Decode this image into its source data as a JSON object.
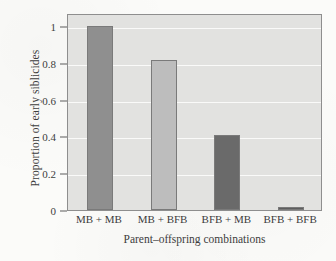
{
  "chart_data": {
    "type": "bar",
    "title": "",
    "xlabel": "Parent–offspring combinations",
    "ylabel": "Proportion of early siblicides",
    "categories": [
      "MB + MB",
      "MB + BFB",
      "BFB + MB",
      "BFB + BFB"
    ],
    "values": [
      1.0,
      0.815,
      0.41,
      0.015
    ],
    "bar_colors": [
      "#8f8f8f",
      "#bdbdbd",
      "#6a6a6a",
      "#5e5e5e"
    ],
    "ylim": [
      0,
      1.07
    ],
    "yticks": [
      0,
      0.2,
      0.4,
      0.6,
      0.8,
      1
    ],
    "ytick_labels": [
      "0",
      "0.2",
      "0.4",
      "0.6",
      "0.8",
      "1"
    ],
    "grid": true,
    "grid_color": "#fbfbfa",
    "legend": "none",
    "panel_color": "#e2e2e0",
    "frame_color": "#8e8e8e",
    "background_color": "#fbfbf9",
    "text_color": "#3d3d3d"
  }
}
